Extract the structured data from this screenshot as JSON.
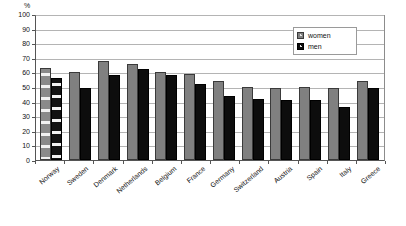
{
  "chart_data": {
    "type": "bar",
    "title": "",
    "xlabel": "",
    "ylabel": "%",
    "ylim": [
      0,
      100
    ],
    "yticks": [
      0,
      10,
      20,
      30,
      40,
      50,
      60,
      70,
      80,
      90,
      100
    ],
    "grid": true,
    "legend_position": "top-right",
    "categories": [
      "Norway",
      "Sweden",
      "Denmark",
      "Netherlands",
      "Belgium",
      "France",
      "Germany",
      "Switzerland",
      "Austria",
      "Spain",
      "Italy",
      "Greece"
    ],
    "series": [
      {
        "name": "women",
        "color": "#808080",
        "values": [
          63,
          60,
          68,
          66,
          60,
          59,
          54,
          50,
          49,
          50,
          49,
          54
        ]
      },
      {
        "name": "men",
        "color": "#0d0d0d",
        "values": [
          56,
          49,
          58,
          62,
          58,
          52,
          44,
          42,
          41,
          41,
          36,
          49
        ]
      }
    ],
    "highlighted_category": "Norway"
  },
  "legend": {
    "items": [
      {
        "label": "women"
      },
      {
        "label": "men"
      }
    ]
  },
  "axis": {
    "unit_label": "%"
  }
}
